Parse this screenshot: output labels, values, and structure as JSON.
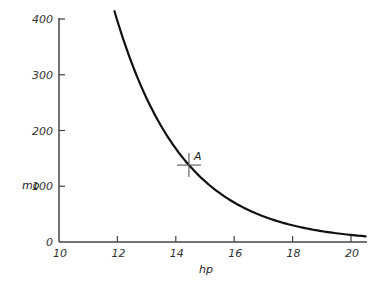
{
  "chart_data": {
    "type": "line",
    "title": "",
    "xlabel": "hp",
    "ylabel": "mo",
    "xlim": [
      10,
      20.5
    ],
    "ylim": [
      0,
      400
    ],
    "x_ticks": [
      10,
      12,
      14,
      16,
      18,
      20
    ],
    "x_tick_labels": [
      "10",
      "12",
      "14",
      "16",
      "18",
      "20"
    ],
    "y_ticks": [
      0,
      100,
      200,
      300,
      400
    ],
    "y_tick_labels": [
      "0",
      "100",
      "200",
      "300",
      "400"
    ],
    "grid": false,
    "legend": null,
    "series": [
      {
        "name": "mo vs hp",
        "x": [
          11.9,
          12.5,
          13.0,
          13.5,
          14.0,
          14.45,
          15.0,
          15.5,
          16.0,
          16.5,
          17.0,
          17.5,
          18.0,
          18.5,
          19.0,
          19.5,
          20.0,
          20.5
        ],
        "y": [
          414,
          320,
          259,
          208,
          168,
          138,
          109,
          88,
          71,
          57,
          46,
          37,
          30,
          24,
          20,
          16,
          13,
          10
        ]
      }
    ],
    "annotations": [
      {
        "label": "A",
        "x": 14.45,
        "y": 138,
        "marker": "cross"
      }
    ]
  }
}
